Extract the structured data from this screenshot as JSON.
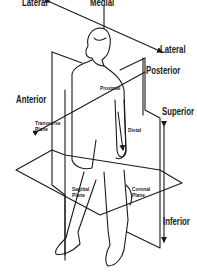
{
  "diagram": {
    "labels": {
      "lateral_left": "Lateral",
      "medial": "Medial",
      "lateral_right": "Lateral",
      "posterior": "Posterior",
      "anterior": "Anterior",
      "proximal": "Proximal",
      "superior": "Superior",
      "distal": "Distal",
      "transverse_plane_line1": "Transverse",
      "transverse_plane_line2": "Plane",
      "sagittal_plane_line1": "Sagittal",
      "sagittal_plane_line2": "Plane",
      "coronal_plane_line1": "Coronal",
      "coronal_plane_line2": "Plane",
      "inferior": "Inferior"
    },
    "colors": {
      "line": "#1a1a1a",
      "background": "#ffffff"
    }
  }
}
